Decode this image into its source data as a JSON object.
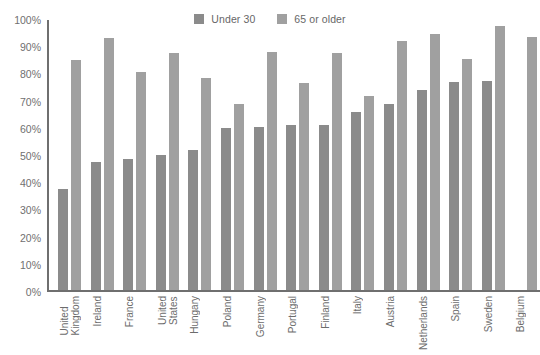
{
  "chart_data": {
    "type": "bar",
    "title": "",
    "subtitle": "",
    "xlabel": "",
    "ylabel": "",
    "ylim": [
      0,
      100
    ],
    "grid": false,
    "legend_position": "top-center",
    "y_ticks": [
      "0%",
      "10%",
      "20%",
      "30%",
      "40%",
      "50%",
      "60%",
      "70%",
      "80%",
      "90%",
      "100%"
    ],
    "y_tick_values": [
      0,
      10,
      20,
      30,
      40,
      50,
      60,
      70,
      80,
      90,
      100
    ],
    "categories": [
      "United Kingdom",
      "Ireland",
      "France",
      "United States",
      "Hungary",
      "Poland",
      "Germany",
      "Portugal",
      "Finland",
      "Italy",
      "Austria",
      "Netherlands",
      "Spain",
      "Sweden",
      "Belgium"
    ],
    "category_lines": [
      [
        "United",
        "Kingdom"
      ],
      [
        "Ireland",
        ""
      ],
      [
        "France",
        ""
      ],
      [
        "United",
        "States"
      ],
      [
        "Hungary",
        ""
      ],
      [
        "Poland",
        ""
      ],
      [
        "Germany",
        ""
      ],
      [
        "Portugal",
        ""
      ],
      [
        "Finland",
        ""
      ],
      [
        "Italy",
        ""
      ],
      [
        "Austria",
        ""
      ],
      [
        "Netherlands",
        ""
      ],
      [
        "Spain",
        ""
      ],
      [
        "Sweden",
        ""
      ],
      [
        "Belgium",
        ""
      ]
    ],
    "series": [
      {
        "name": "Under 30",
        "color": "#8b8b8b",
        "values": [
          37,
          47,
          48,
          49.5,
          51.5,
          59.5,
          60,
          60.5,
          60.5,
          65.5,
          68.5,
          73.5,
          76.5,
          77,
          null
        ]
      },
      {
        "name": "65 or older",
        "color": "#a0a0a0",
        "values": [
          84.5,
          92.5,
          80,
          87,
          78,
          68.5,
          87.5,
          76,
          87,
          71.5,
          91.5,
          94,
          85,
          97,
          93
        ]
      }
    ]
  },
  "legend": {
    "items": [
      {
        "label": "Under 30",
        "color": "#8b8b8b"
      },
      {
        "label": "65 or older",
        "color": "#a0a0a0"
      }
    ]
  },
  "axes": {
    "y_axis_color": "#6f6f6f",
    "x_axis_color": "#6f6f6f"
  }
}
